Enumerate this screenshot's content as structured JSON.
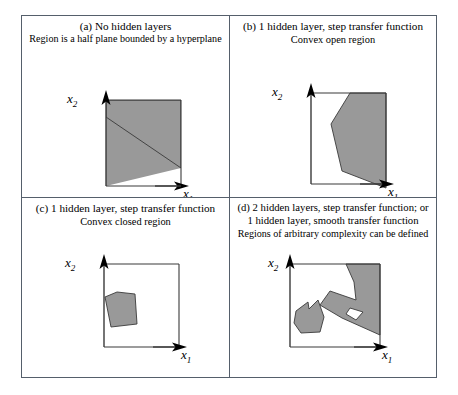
{
  "figure": {
    "panels": [
      {
        "id": "a",
        "caption_main": "(a) No hidden layers",
        "caption_sub": "Region is a half plane bounded by a hyperplane",
        "y_axis_label": "x",
        "y_axis_sub": "2",
        "x_axis_label": "x",
        "x_axis_sub": "1",
        "region_description": "half plane: shaded band across the top bounded by a descending hyperplane"
      },
      {
        "id": "b",
        "caption_main": "(b) 1 hidden layer, step transfer function",
        "caption_sub": "Convex open region",
        "y_axis_label": "x",
        "y_axis_sub": "2",
        "x_axis_label": "x",
        "x_axis_sub": "1",
        "region_description": "convex open region attached to the right edge of the axes box"
      },
      {
        "id": "c",
        "caption_main": "(c) 1 hidden layer, step transfer function",
        "caption_sub": "Convex closed region",
        "y_axis_label": "x",
        "y_axis_sub": "2",
        "x_axis_label": "x",
        "x_axis_sub": "1",
        "region_description": "small closed convex pentagon in the lower left of the axes box"
      },
      {
        "id": "d",
        "caption_main": "(d) 2 hidden layers, step transfer function; or",
        "caption_main2": "1 hidden layer, smooth transfer function",
        "caption_sub": "Regions of arbitrary complexity can be defined",
        "y_axis_label": "x",
        "y_axis_sub": "2",
        "x_axis_label": "x",
        "x_axis_sub": "1",
        "region_description": "two disjoint non-convex regions, the larger containing a white hole"
      }
    ]
  },
  "colors": {
    "region_fill": "#999999",
    "region_stroke": "#3a3a3a",
    "axis": "#3a3a3a",
    "frame": "#555f6b",
    "background": "#ffffff"
  }
}
